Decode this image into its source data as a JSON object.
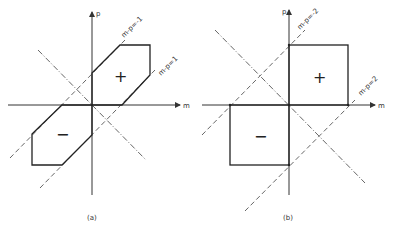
{
  "panels": [
    {
      "id": "a",
      "caption": "(a)",
      "axis_x_label": "m",
      "axis_y_label": "p",
      "line_labels": [
        "m-p=-1",
        "m-p=1"
      ],
      "region_signs": [
        "+",
        "−"
      ]
    },
    {
      "id": "b",
      "caption": "(b)",
      "axis_x_label": "m",
      "axis_y_label": "p",
      "line_labels": [
        "m-p=-2",
        "m-p=2"
      ],
      "region_signs": [
        "+",
        "−"
      ]
    }
  ]
}
